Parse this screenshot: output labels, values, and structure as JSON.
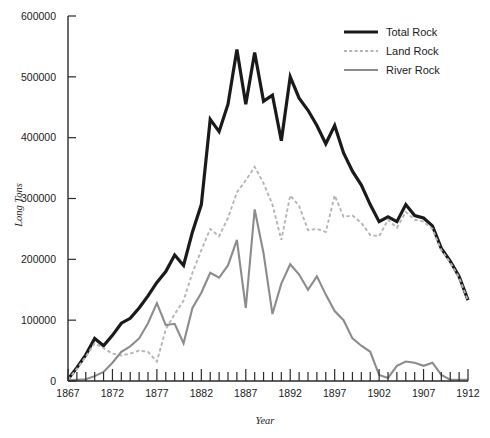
{
  "chart_data": {
    "type": "line",
    "title": "",
    "xlabel": "Year",
    "ylabel": "Long Tons",
    "xlim": [
      1867,
      1912
    ],
    "ylim": [
      0,
      600000
    ],
    "grid": false,
    "legend_position": "top-right",
    "x_tick_labels": [
      "1867",
      "1872",
      "1877",
      "1882",
      "1887",
      "1892",
      "1897",
      "1902",
      "1907",
      "1912"
    ],
    "x_tick_values": [
      1867,
      1872,
      1877,
      1882,
      1887,
      1892,
      1897,
      1902,
      1907,
      1912
    ],
    "x_minor_step": 1,
    "y_tick_labels": [
      "0",
      "100000",
      "200000",
      "300000",
      "400000",
      "500000",
      "600000"
    ],
    "y_tick_values": [
      0,
      100000,
      200000,
      300000,
      400000,
      500000,
      600000
    ],
    "x": [
      1867,
      1868,
      1869,
      1870,
      1871,
      1872,
      1873,
      1874,
      1875,
      1876,
      1877,
      1878,
      1879,
      1880,
      1881,
      1882,
      1883,
      1884,
      1885,
      1886,
      1887,
      1888,
      1889,
      1890,
      1891,
      1892,
      1893,
      1894,
      1895,
      1896,
      1897,
      1898,
      1899,
      1900,
      1901,
      1902,
      1903,
      1904,
      1905,
      1906,
      1907,
      1908,
      1909,
      1910,
      1911,
      1912
    ],
    "series": [
      {
        "name": "Total Rock",
        "color": "#1a1a1a",
        "style": "solid",
        "width": 3.2,
        "values": [
          3000,
          22000,
          43000,
          70000,
          58000,
          75000,
          95000,
          103000,
          120000,
          140000,
          162000,
          180000,
          207000,
          190000,
          245000,
          290000,
          430000,
          410000,
          455000,
          545000,
          455000,
          540000,
          460000,
          470000,
          395000,
          500000,
          465000,
          445000,
          420000,
          390000,
          420000,
          375000,
          345000,
          322000,
          290000,
          262000,
          270000,
          262000,
          290000,
          272000,
          268000,
          255000,
          218000,
          197000,
          172000,
          133000
        ]
      },
      {
        "name": "Land Rock",
        "color": "#b5b5b5",
        "style": "dashed",
        "width": 1.9,
        "values": [
          2000,
          20000,
          40000,
          62000,
          54000,
          45000,
          42000,
          45000,
          50000,
          48000,
          32000,
          85000,
          110000,
          132000,
          178000,
          215000,
          250000,
          238000,
          268000,
          310000,
          330000,
          352000,
          325000,
          290000,
          232000,
          305000,
          288000,
          248000,
          250000,
          245000,
          305000,
          270000,
          272000,
          260000,
          240000,
          238000,
          265000,
          252000,
          278000,
          265000,
          262000,
          250000,
          215000,
          195000,
          170000,
          132000
        ]
      },
      {
        "name": "River Rock",
        "color": "#8c8c8c",
        "style": "solid",
        "width": 2.1,
        "values": [
          1000,
          2000,
          3000,
          8000,
          15000,
          30000,
          48000,
          57000,
          70000,
          95000,
          128000,
          92000,
          94000,
          62000,
          120000,
          145000,
          178000,
          170000,
          190000,
          232000,
          120000,
          282000,
          210000,
          110000,
          160000,
          192000,
          175000,
          150000,
          172000,
          142000,
          115000,
          100000,
          70000,
          58000,
          48000,
          10000,
          5000,
          25000,
          32000,
          30000,
          25000,
          30000,
          10000,
          2000,
          2000,
          2000
        ]
      }
    ],
    "legend": [
      {
        "label": "Total Rock",
        "color": "#1a1a1a",
        "style": "solid"
      },
      {
        "label": "Land Rock",
        "color": "#b5b5b5",
        "style": "dashed"
      },
      {
        "label": "River Rock",
        "color": "#8c8c8c",
        "style": "solid"
      }
    ]
  },
  "axes": {
    "x_title": "Year",
    "y_title": "Long Tons"
  }
}
